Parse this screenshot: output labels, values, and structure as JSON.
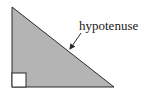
{
  "diagram": {
    "type": "right-triangle",
    "label": "hypotenuse",
    "colors": {
      "fill": "#b4b4b4",
      "stroke": "#2a2a2a",
      "square_fill": "#ffffff",
      "text": "#1a1a1a"
    },
    "vertices": {
      "top": [
        12,
        7
      ],
      "bottom_left": [
        12,
        87
      ],
      "bottom_right": [
        114,
        87
      ]
    },
    "right_angle_marker": {
      "x": 12,
      "y": 73,
      "size": 14
    },
    "arrow": {
      "from": [
        81,
        33
      ],
      "to": [
        70,
        49
      ]
    }
  }
}
